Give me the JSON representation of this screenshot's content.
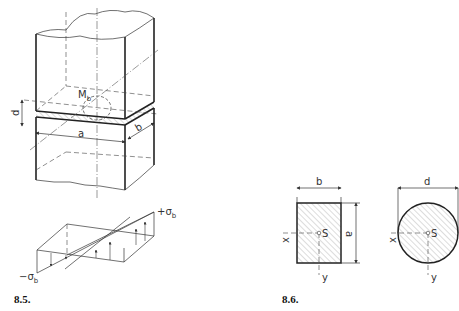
{
  "figures": [
    {
      "id": "8.5",
      "caption": "8.5.",
      "title": "Bending stress in a rectangular beam section",
      "labels": {
        "moment": "M",
        "moment_sub": "b",
        "thickness": "d",
        "width": "a",
        "depth": "b",
        "stress_pos": "+σ",
        "stress_pos_sub": "b",
        "stress_neg": "−σ",
        "stress_neg_sub": "b"
      }
    },
    {
      "id": "8.6",
      "caption": "8.6.",
      "title": "Cross sections with centroid S",
      "rectangle": {
        "width_label": "b",
        "height_label": "a",
        "centroid": "S",
        "x_axis": "x",
        "y_axis": "y"
      },
      "circle": {
        "diameter_label": "d",
        "centroid": "S",
        "x_axis": "x",
        "y_axis": "y"
      }
    }
  ],
  "colors": {
    "line": "#222222",
    "hatch": "#888888",
    "band": "#aaaaaa"
  }
}
